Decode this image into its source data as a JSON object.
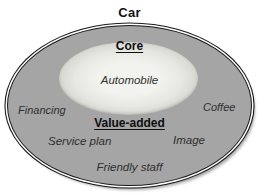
{
  "diagram": {
    "title": "Car",
    "core": {
      "heading": "Core",
      "item": "Automobile"
    },
    "value_added": {
      "heading": "Value-added",
      "items": [
        {
          "label": "Financing",
          "position": "left"
        },
        {
          "label": "Coffee",
          "position": "right"
        },
        {
          "label": "Service plan",
          "position": "bottom-left"
        },
        {
          "label": "Image",
          "position": "bottom-right"
        },
        {
          "label": "Friendly staff",
          "position": "bottom-center"
        }
      ]
    },
    "colors": {
      "background": "#ffffff",
      "outer_ring_fill": "#a5a5a5",
      "inner_ellipse_fill": "#e9e9e5",
      "border": "#1b1b1b",
      "heading_text": "#0e0e0e",
      "item_text": "#2f2f2f"
    }
  }
}
